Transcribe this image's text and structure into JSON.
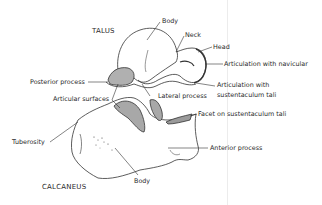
{
  "diagram": {
    "bones": {
      "talus": "TALUS",
      "calcaneus": "CALCANEUS"
    },
    "labels": {
      "talus_body": "Body",
      "neck": "Neck",
      "head": "Head",
      "articulation_navicular": "Articulation with navicular",
      "articulation_sustentaculum_line1": "Articulation with",
      "articulation_sustentaculum_line2": "sustentaculum tali",
      "posterior_process": "Posterior process",
      "articular_surfaces": "Articular surfaces",
      "lateral_process": "Lateral process",
      "facet_sustentaculum": "Facet on sustentaculum tali",
      "tuberosity": "Tuberosity",
      "anterior_process": "Anterior process",
      "calcaneus_body": "Body"
    },
    "colors": {
      "line": "#333333",
      "shade": "#9a9a9a",
      "background": "#ffffff"
    }
  }
}
